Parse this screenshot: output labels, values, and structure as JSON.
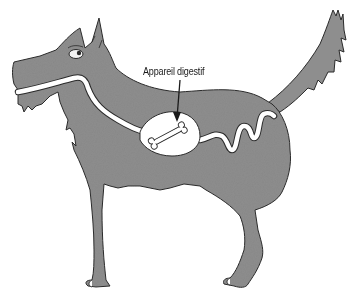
{
  "diagram": {
    "label": "Appareil digestif",
    "annotation_target": "stomach",
    "contents_of_stomach": "bone",
    "colors": {
      "body_fill": "#8e8e8e",
      "outline": "#2a2a2a",
      "digestive_tract": "#ffffff",
      "background": "#ffffff"
    }
  }
}
